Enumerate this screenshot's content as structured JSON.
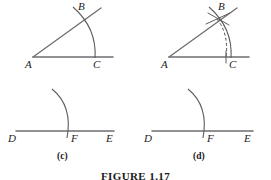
{
  "figure": {
    "caption": "FIGURE 1.17",
    "stroke_color": "#6e6e70",
    "arc_color": "#5d5d5f",
    "label_color": "#232323"
  },
  "panels": [
    {
      "id": "a",
      "caption": "",
      "labels": {
        "vertex": "A",
        "ray_point": "B",
        "base_point": "C"
      },
      "description": "angle with arc crossing both rays"
    },
    {
      "id": "b",
      "caption": "",
      "labels": {
        "vertex": "A",
        "ray_point": "B",
        "base_point": "C"
      },
      "description": "angle with arc, dashed chord arc from B to C and tick marks at B"
    },
    {
      "id": "c",
      "caption": "(c)",
      "labels": {
        "left": "D",
        "middle": "F",
        "right": "E"
      },
      "description": "line D F E with arc crossing at F"
    },
    {
      "id": "d",
      "caption": "(d)",
      "labels": {
        "left": "D",
        "middle": "F",
        "right": "E"
      },
      "description": "line D F E with arc crossing at F"
    }
  ]
}
